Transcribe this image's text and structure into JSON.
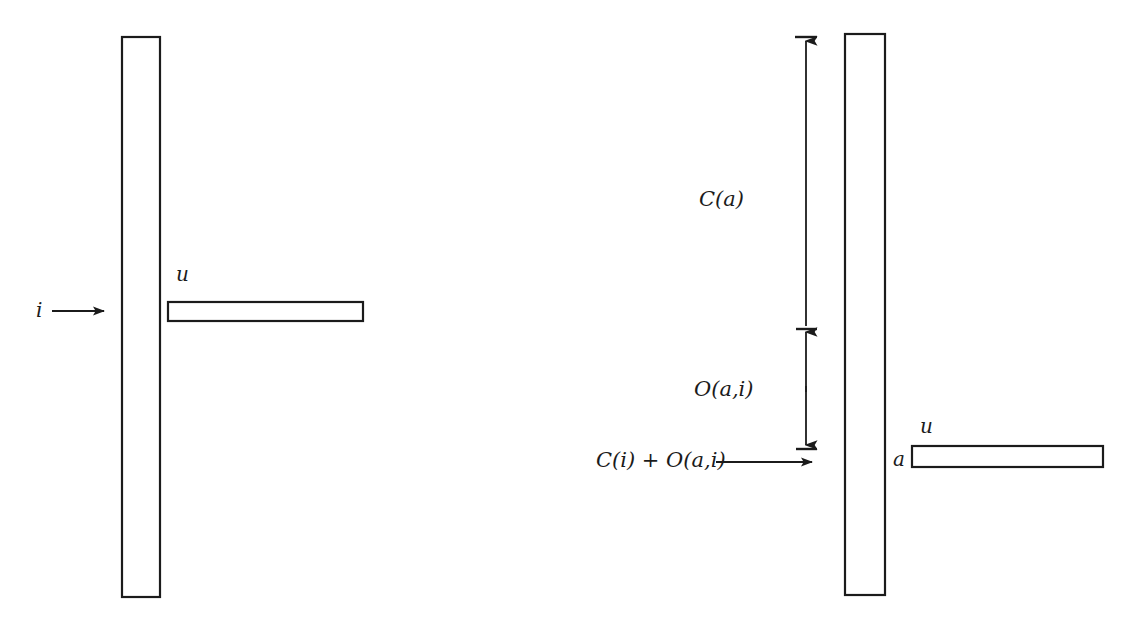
{
  "figure": {
    "type": "diagram",
    "style": "hand-drawn technical schematic, black ink on white",
    "background_color": "#ffffff",
    "stroke_color": "#1b1b1b",
    "width": 1138,
    "height": 621,
    "panels": [
      {
        "id": "left-panel",
        "name": "base-case-timeline",
        "vertical_bar": {
          "x": 122,
          "y": 37,
          "width": 38,
          "height": 560
        },
        "horizontal_bar": {
          "x": 168,
          "y": 302,
          "width": 195,
          "height": 19
        },
        "labels": [
          {
            "id": "left-u",
            "text": "u",
            "x": 176,
            "y": 264
          },
          {
            "id": "left-i",
            "text": "i",
            "x": 36,
            "y": 300
          }
        ],
        "arrows": [
          {
            "id": "left-i-arrow",
            "direction": "right",
            "x1": 52,
            "y1": 311,
            "x2": 107,
            "y2": 311
          }
        ]
      },
      {
        "id": "right-panel",
        "name": "offset-case-timeline",
        "vertical_bar": {
          "x": 845,
          "y": 34,
          "width": 40,
          "height": 561
        },
        "horizontal_bar": {
          "x": 912,
          "y": 446,
          "width": 191,
          "height": 21
        },
        "labels": [
          {
            "id": "right-u",
            "text": "u",
            "x": 920,
            "y": 416
          },
          {
            "id": "right-a",
            "text": "a",
            "x": 893,
            "y": 449
          },
          {
            "id": "measure-ca",
            "text": "C(a)",
            "x": 699,
            "y": 189
          },
          {
            "id": "measure-oai",
            "text": "O(a,i)",
            "x": 694,
            "y": 379
          },
          {
            "id": "measure-ci-plus-oai",
            "text": "C(i) + O(a,i)",
            "x": 596,
            "y": 450
          }
        ],
        "measures": [
          {
            "id": "ca-span",
            "label": "C(a)",
            "orientation": "vertical",
            "x": 806,
            "y_top": 37,
            "y_bottom": 328,
            "arrowhead": "top",
            "tick_top": true,
            "tick_bottom": true
          },
          {
            "id": "oai-span",
            "label": "O(a,i)",
            "orientation": "vertical",
            "x": 806,
            "y_top": 330,
            "y_bottom": 450,
            "arrowhead": "both",
            "tick_top": true,
            "tick_bottom": true
          },
          {
            "id": "ci-oai-pointer",
            "label": "C(i) + O(a,i)",
            "orientation": "horizontal",
            "x1": 716,
            "x2": 814,
            "y": 462,
            "arrowhead": "right"
          }
        ]
      }
    ]
  }
}
